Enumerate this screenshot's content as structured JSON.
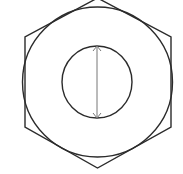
{
  "diagram": {
    "title": "",
    "colors": {
      "background": "#ffffff",
      "outline": "#2b2b2b",
      "dimension": "#777777"
    },
    "hexagon": {
      "orientation": "pointy-top",
      "points": [
        [
          97.5,
          -2
        ],
        [
          171,
          37
        ],
        [
          171,
          127
        ],
        [
          97.5,
          168
        ],
        [
          25,
          127
        ],
        [
          25,
          37
        ]
      ]
    },
    "outer_circle": {
      "cx": 97.5,
      "cy": 82,
      "r": 75
    },
    "inner_circle": {
      "cx": 97,
      "cy": 82,
      "rx": 35,
      "ry": 36
    },
    "dimension_line": {
      "orientation": "vertical",
      "x": 97,
      "y1": 46,
      "y2": 118,
      "arrowheads": "both",
      "label": ""
    }
  }
}
